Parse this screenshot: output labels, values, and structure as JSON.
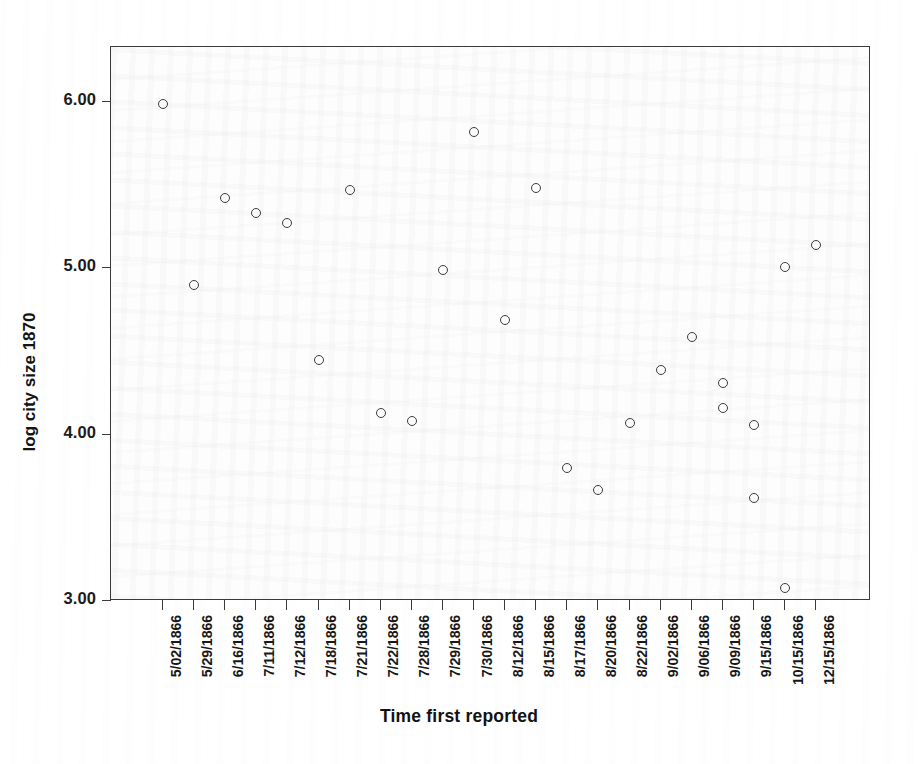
{
  "chart_data": {
    "type": "scatter",
    "title": "",
    "xlabel": "Time first reported",
    "ylabel": "log city size 1870",
    "ylim": [
      3.0,
      6.25
    ],
    "yticks": [
      "3.00",
      "4.00",
      "5.00",
      "6.00"
    ],
    "ytick_values": [
      3.0,
      4.0,
      5.0,
      6.0
    ],
    "grid": false,
    "legend": "none",
    "marker": "open-circle",
    "marker_color": "#3c3c42",
    "categories": [
      "5/02/1866",
      "5/29/1866",
      "6/16/1866",
      "7/11/1866",
      "7/12/1866",
      "7/18/1866",
      "7/21/1866",
      "7/22/1866",
      "7/28/1866",
      "7/29/1866",
      "7/30/1866",
      "8/12/1866",
      "8/15/1866",
      "8/17/1866",
      "8/20/1866",
      "8/22/1866",
      "9/02/1866",
      "9/06/1866",
      "9/09/1866",
      "9/15/1866",
      "10/15/1866",
      "12/15/1866"
    ],
    "points": [
      {
        "x": "5/02/1866",
        "x_index": 0,
        "y": 5.99
      },
      {
        "x": "5/29/1866",
        "x_index": 1,
        "y": 4.9
      },
      {
        "x": "6/16/1866",
        "x_index": 2,
        "y": 5.42
      },
      {
        "x": "7/11/1866",
        "x_index": 3,
        "y": 5.33
      },
      {
        "x": "7/12/1866",
        "x_index": 4,
        "y": 5.27
      },
      {
        "x": "7/18/1866",
        "x_index": 5,
        "y": 4.45
      },
      {
        "x": "7/21/1866",
        "x_index": 6,
        "y": 5.47
      },
      {
        "x": "7/22/1866",
        "x_index": 7,
        "y": 4.13
      },
      {
        "x": "7/28/1866",
        "x_index": 8,
        "y": 4.08
      },
      {
        "x": "7/29/1866",
        "x_index": 9,
        "y": 4.99
      },
      {
        "x": "7/30/1866",
        "x_index": 10,
        "y": 5.82
      },
      {
        "x": "8/12/1866",
        "x_index": 11,
        "y": 4.69
      },
      {
        "x": "8/15/1866",
        "x_index": 12,
        "y": 5.48
      },
      {
        "x": "8/17/1866",
        "x_index": 13,
        "y": 3.8
      },
      {
        "x": "8/20/1866",
        "x_index": 14,
        "y": 3.67
      },
      {
        "x": "8/22/1866",
        "x_index": 15,
        "y": 4.07
      },
      {
        "x": "9/02/1866",
        "x_index": 16,
        "y": 4.39
      },
      {
        "x": "9/06/1866",
        "x_index": 17,
        "y": 4.59
      },
      {
        "x": "9/09/1866",
        "x_index": 18,
        "y": 4.31
      },
      {
        "x": "9/09/1866",
        "x_index": 18,
        "y": 4.16
      },
      {
        "x": "9/15/1866",
        "x_index": 19,
        "y": 4.06
      },
      {
        "x": "9/15/1866",
        "x_index": 19,
        "y": 3.62
      },
      {
        "x": "10/15/1866",
        "x_index": 20,
        "y": 5.01
      },
      {
        "x": "10/15/1866",
        "x_index": 20,
        "y": 3.08
      },
      {
        "x": "12/15/1866",
        "x_index": 21,
        "y": 5.14
      }
    ]
  }
}
